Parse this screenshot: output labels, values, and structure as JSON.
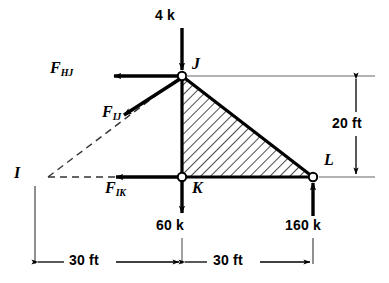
{
  "figure": {
    "joints": [
      {
        "id": "J",
        "label": "J",
        "x": 182,
        "y": 76
      },
      {
        "id": "K",
        "label": "K",
        "x": 182,
        "y": 177
      },
      {
        "id": "L",
        "label": "L",
        "x": 313,
        "y": 177
      },
      {
        "id": "I",
        "label": "I",
        "x": 42,
        "y": 178
      }
    ],
    "joint_labels": [
      {
        "name": "joint-label-j",
        "text": "J",
        "x": 192,
        "y": 60
      },
      {
        "name": "joint-label-k",
        "text": "K",
        "x": 192,
        "y": 182
      },
      {
        "name": "joint-label-l",
        "text": "L",
        "x": 324,
        "y": 156
      },
      {
        "name": "joint-label-i",
        "text": "I",
        "x": 15,
        "y": 167
      }
    ],
    "forces": [
      {
        "name": "applied-load-top",
        "symbol": "4 k",
        "magnitude": 4,
        "unit": "k",
        "direction": "down",
        "at_joint": "J",
        "label_x": 156,
        "label_y": 12
      },
      {
        "name": "member-force-hj",
        "symbol": "F",
        "subscript": "HJ",
        "direction": "left",
        "at_joint": "J",
        "label_x": 54,
        "label_y": 67
      },
      {
        "name": "member-force-ij",
        "symbol": "F",
        "subscript": "IJ",
        "direction": "down-left",
        "at_joint": "J",
        "label_x": 105,
        "label_y": 110
      },
      {
        "name": "member-force-ik",
        "symbol": "F",
        "subscript": "IK",
        "direction": "left",
        "at_joint": "K",
        "label_x": 108,
        "label_y": 186
      },
      {
        "name": "applied-load-k",
        "symbol": "60 k",
        "magnitude": 60,
        "unit": "k",
        "direction": "down",
        "at_joint": "K",
        "label_x": 157,
        "label_y": 224
      },
      {
        "name": "reaction-load-l",
        "symbol": "160 k",
        "magnitude": 160,
        "unit": "k",
        "direction": "up",
        "at_joint": "L",
        "label_x": 286,
        "label_y": 224
      }
    ],
    "dimensions": [
      {
        "name": "dimension-height",
        "text": "20 ft",
        "value": 20,
        "unit": "ft",
        "orientation": "vertical",
        "label_x": 333,
        "label_y": 124
      },
      {
        "name": "dimension-span-left",
        "text": "30 ft",
        "value": 30,
        "unit": "ft",
        "orientation": "horizontal",
        "label_x": 79,
        "label_y": 253
      },
      {
        "name": "dimension-span-right",
        "text": "30 ft",
        "value": 30,
        "unit": "ft",
        "orientation": "horizontal",
        "label_x": 222,
        "label_y": 253
      }
    ],
    "colors": {
      "line": "#000000",
      "hatch": "#1a1a1a",
      "thin_line": "#555555",
      "background": "#ffffff"
    }
  }
}
